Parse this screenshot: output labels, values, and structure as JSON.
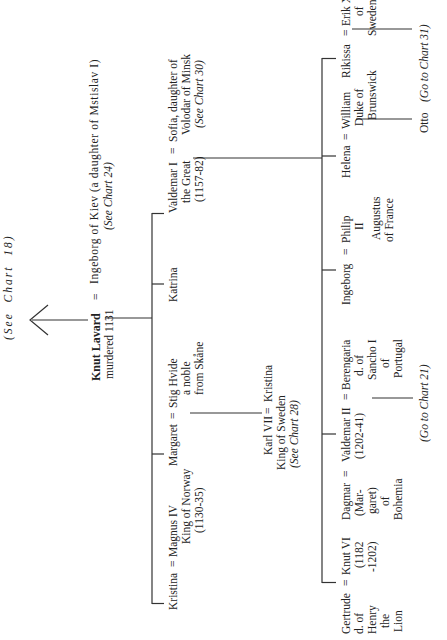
{
  "chart": {
    "orientation": "rotated-90-ccw",
    "top_reference": "(See  Chart  18)",
    "root": {
      "name": "Knut Lavard",
      "note": "murdered 1131",
      "spouse": "Ingeborg of Kiev (a daughter of Mstislav I)",
      "spouse_ref": "(See Chart 24)"
    },
    "generation1": [
      {
        "name": "Kristina",
        "spouse": "Magnus IV",
        "spouse_lines": [
          "King of Norway",
          "(1130-35)"
        ]
      },
      {
        "name": "Margaret",
        "spouse": "Stig Hvide",
        "spouse_lines": [
          "a noble",
          "from Skåne"
        ],
        "child": {
          "name": "Kristina",
          "spouse": "Karl VII",
          "spouse_lines": [
            "King of Sweden",
            "(See Chart 28)"
          ]
        }
      },
      {
        "name": "Katrina"
      },
      {
        "name": "Valdemar I",
        "name_lines": [
          "the Great",
          "(1157-82)"
        ],
        "spouse": "Sofia, daughter of",
        "spouse_lines": [
          "Volodar of Minsk",
          "(See Chart 30)"
        ]
      }
    ],
    "generation2": [
      {
        "name": "Knut VI",
        "name_lines": [
          "(1182",
          "-1202)"
        ],
        "spouse": "Gertrude",
        "spouse_lines": [
          "d. of",
          "Henry",
          "the",
          "Lion"
        ]
      },
      {
        "name": "Valdemar II",
        "name_lines": [
          "(1202-41)"
        ],
        "spouse_before": "Dagmar",
        "spouse_before_lines": [
          "(Mar-",
          "garet)",
          "of",
          "Bohemia"
        ],
        "spouse_after": "Berengaria",
        "spouse_after_lines": [
          "d. of",
          "Sancho I",
          "of",
          "Portugal"
        ],
        "child_ref": "(Go to Chart 21)"
      },
      {
        "name": "Ingeborg",
        "spouse": "Philip",
        "spouse_lines": [
          "II",
          "Augustus",
          "of France"
        ]
      },
      {
        "name": "Helena",
        "spouse": "William",
        "spouse_lines": [
          "Duke of",
          "Brunswick"
        ],
        "child": "Otto"
      },
      {
        "name": "Rikissa",
        "spouse": "Erik X",
        "spouse_lines": [
          "of",
          "Sweden"
        ],
        "child_ref": "(Go to Chart 31)"
      }
    ],
    "eq": "="
  }
}
